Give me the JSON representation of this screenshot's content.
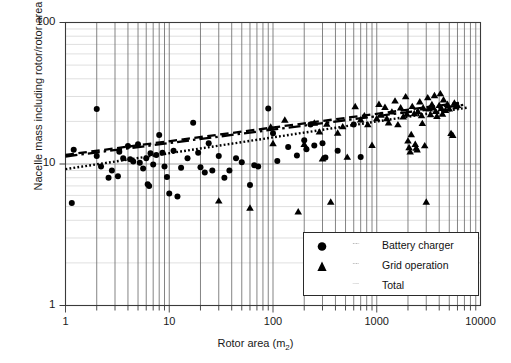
{
  "chart_data": {
    "type": "scatter",
    "title": "",
    "xlabel": "Rotor area (m2)",
    "xlabel_base": "Rotor area (m",
    "xlabel_sub": "2",
    "xlabel_tail": ")",
    "ylabel": "Nacelle mass including rotor/rotor area",
    "xscale": "log",
    "yscale": "log",
    "xlim": [
      1,
      10000
    ],
    "ylim": [
      1,
      100
    ],
    "xticks": [
      "1",
      "10",
      "100",
      "1000",
      "10000"
    ],
    "xtick_values": [
      1,
      10,
      100,
      1000,
      10000
    ],
    "yticks": [
      "1",
      "10",
      "100"
    ],
    "ytick_values": [
      1,
      10,
      100
    ],
    "grid": "major and minor log gridlines, vertical dark, horizontal faint",
    "legend_position": "lower right inside axes",
    "series": [
      {
        "name": "Battery charger",
        "marker": "circle",
        "line_style": "dash-dot",
        "color": "#000000",
        "points": [
          [
            1.15,
            5.3
          ],
          [
            1.2,
            12.6
          ],
          [
            2.0,
            24.5
          ],
          [
            2.0,
            11.4
          ],
          [
            2.2,
            9.6
          ],
          [
            2.6,
            8.0
          ],
          [
            2.8,
            9.0
          ],
          [
            3.2,
            8.2
          ],
          [
            3.3,
            12.2
          ],
          [
            3.6,
            11.0
          ],
          [
            4.0,
            13.4
          ],
          [
            4.2,
            10.8
          ],
          [
            4.5,
            10.4
          ],
          [
            5.0,
            13.8
          ],
          [
            5.2,
            10.2
          ],
          [
            5.6,
            9.3
          ],
          [
            6.0,
            11.0
          ],
          [
            6.2,
            7.2
          ],
          [
            6.4,
            7.0
          ],
          [
            6.6,
            11.9
          ],
          [
            7.0,
            9.9
          ],
          [
            7.5,
            11.6
          ],
          [
            8.0,
            16.0
          ],
          [
            8.6,
            12.0
          ],
          [
            9.0,
            9.6
          ],
          [
            9.5,
            8.1
          ],
          [
            10.0,
            6.2
          ],
          [
            11.0,
            12.4
          ],
          [
            12.0,
            5.9
          ],
          [
            13.0,
            9.4
          ],
          [
            15.0,
            11.0
          ],
          [
            17.0,
            19.6
          ],
          [
            19.0,
            12.0
          ],
          [
            20.0,
            9.5
          ],
          [
            22.0,
            8.7
          ],
          [
            24.0,
            14.0
          ],
          [
            26.0,
            9.0
          ],
          [
            30.0,
            11.4
          ],
          [
            34.0,
            8.0
          ],
          [
            38.0,
            9.0
          ],
          [
            44.0,
            11.0
          ],
          [
            50.0,
            10.3
          ],
          [
            60.0,
            7.1
          ],
          [
            66.0,
            9.8
          ],
          [
            72.0,
            9.6
          ],
          [
            90.0,
            24.7
          ],
          [
            100.0,
            16.5
          ],
          [
            110.0,
            10.5
          ],
          [
            140.0,
            13.2
          ],
          [
            170.0,
            11.5
          ],
          [
            200.0,
            14.7
          ],
          [
            210.0,
            12.7
          ],
          [
            230.0,
            19.0
          ],
          [
            250.0,
            13.5
          ],
          [
            300.0,
            14.0
          ],
          [
            320.0,
            11.1
          ],
          [
            420.0,
            12.4
          ],
          [
            600.0,
            19.0
          ],
          [
            700.0,
            11.2
          ]
        ]
      },
      {
        "name": "Grid operation",
        "marker": "triangle",
        "line_style": "dashed",
        "color": "#000000",
        "points": [
          [
            30.0,
            5.5
          ],
          [
            60.0,
            4.9
          ],
          [
            95.0,
            18.3
          ],
          [
            100.0,
            14.0
          ],
          [
            130.0,
            20.5
          ],
          [
            175.0,
            4.6
          ],
          [
            200.0,
            13.8
          ],
          [
            250.0,
            19.5
          ],
          [
            280.0,
            16.9
          ],
          [
            300.0,
            10.9
          ],
          [
            330.0,
            19.2
          ],
          [
            360.0,
            5.4
          ],
          [
            420.0,
            16.6
          ],
          [
            470.0,
            18.4
          ],
          [
            520.0,
            11.2
          ],
          [
            620.0,
            25.5
          ],
          [
            700.0,
            20.6
          ],
          [
            760.0,
            22.0
          ],
          [
            820.0,
            19.0
          ],
          [
            900.0,
            13.6
          ],
          [
            1000.0,
            21.0
          ],
          [
            1050.0,
            26.5
          ],
          [
            1100.0,
            22.2
          ],
          [
            1200.0,
            25.2
          ],
          [
            1250.0,
            21.0
          ],
          [
            1300.0,
            19.6
          ],
          [
            1400.0,
            23.4
          ],
          [
            1500.0,
            28.0
          ],
          [
            1600.0,
            19.0
          ],
          [
            1700.0,
            25.0
          ],
          [
            1800.0,
            21.6
          ],
          [
            1900.0,
            30.0
          ],
          [
            1950.0,
            22.6
          ],
          [
            2000.0,
            14.6
          ],
          [
            2050.0,
            13.1
          ],
          [
            2100.0,
            12.2
          ],
          [
            2150.0,
            16.2
          ],
          [
            2200.0,
            25.6
          ],
          [
            2300.0,
            22.8
          ],
          [
            2350.0,
            13.8
          ],
          [
            2400.0,
            13.0
          ],
          [
            2450.0,
            12.6
          ],
          [
            2500.0,
            23.5
          ],
          [
            2600.0,
            27.6
          ],
          [
            2700.0,
            22.0
          ],
          [
            2750.0,
            19.4
          ],
          [
            2800.0,
            25.0
          ],
          [
            2900.0,
            13.5
          ],
          [
            3000.0,
            5.4
          ],
          [
            3100.0,
            29.5
          ],
          [
            3200.0,
            24.6
          ],
          [
            3300.0,
            22.4
          ],
          [
            3400.0,
            26.4
          ],
          [
            3500.0,
            25.0
          ],
          [
            3600.0,
            30.5
          ],
          [
            3700.0,
            23.6
          ],
          [
            3800.0,
            21.8
          ],
          [
            4000.0,
            26.0
          ],
          [
            4100.0,
            31.5
          ],
          [
            4200.0,
            24.8
          ],
          [
            4300.0,
            22.6
          ],
          [
            4400.0,
            28.5
          ],
          [
            4600.0,
            24.0
          ],
          [
            4800.0,
            26.5
          ],
          [
            5000.0,
            24.6
          ],
          [
            5200.0,
            16.5
          ],
          [
            5400.0,
            16.0
          ],
          [
            5600.0,
            27.0
          ],
          [
            5800.0,
            25.5
          ],
          [
            6000.0,
            26.0
          ]
        ]
      },
      {
        "name": "Total",
        "marker": "none",
        "line_style": "dotted",
        "color": "#000000",
        "points": []
      }
    ],
    "trendlines": [
      {
        "name": "Battery charger",
        "style": "dash-dot",
        "x0": 1.0,
        "y0": 11.3,
        "x1": 7000.0,
        "y1": 26.2
      },
      {
        "name": "Grid operation",
        "style": "dashed",
        "x0": 1.0,
        "y0": 11.6,
        "x1": 6200.0,
        "y1": 27.0
      },
      {
        "name": "Total",
        "style": "dotted",
        "x0": 1.0,
        "y0": 9.2,
        "x1": 7400.0,
        "y1": 25.0
      }
    ]
  },
  "legend": {
    "items": [
      {
        "label": "Battery charger",
        "marker": "circle",
        "line": "dash-dot"
      },
      {
        "label": "Grid operation",
        "marker": "triangle",
        "line": "dashed"
      },
      {
        "label": "Total",
        "marker": "none",
        "line": "dotted"
      }
    ]
  }
}
